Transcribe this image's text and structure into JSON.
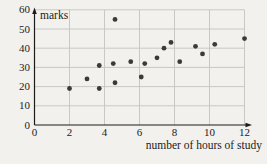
{
  "chart_data": {
    "type": "scatter",
    "title": "",
    "ylabel": "marks",
    "xlabel": "number of hours of study",
    "x_ticks": [
      0,
      2,
      4,
      6,
      8,
      10,
      12
    ],
    "y_ticks": [
      0,
      10,
      20,
      30,
      40,
      50,
      60
    ],
    "xlim": [
      0,
      12.4
    ],
    "ylim": [
      0,
      61
    ],
    "grid": true,
    "legend": "none",
    "points": [
      {
        "x": 2,
        "y": 19
      },
      {
        "x": 3,
        "y": 24
      },
      {
        "x": 3.7,
        "y": 31
      },
      {
        "x": 3.7,
        "y": 19
      },
      {
        "x": 4.5,
        "y": 32
      },
      {
        "x": 4.6,
        "y": 55
      },
      {
        "x": 4.6,
        "y": 22
      },
      {
        "x": 5.5,
        "y": 33
      },
      {
        "x": 6.1,
        "y": 25
      },
      {
        "x": 6.3,
        "y": 32
      },
      {
        "x": 7,
        "y": 35
      },
      {
        "x": 7.4,
        "y": 40
      },
      {
        "x": 7.8,
        "y": 43
      },
      {
        "x": 8.3,
        "y": 33
      },
      {
        "x": 9.2,
        "y": 41
      },
      {
        "x": 9.6,
        "y": 37
      },
      {
        "x": 10.3,
        "y": 42
      },
      {
        "x": 12,
        "y": 45
      }
    ],
    "colors": {
      "background": "#f2f1ee",
      "grid": "#c9c8c5",
      "axis": "#1c1c1c",
      "point": "#3a3a3a",
      "text": "#1b1b1b"
    }
  }
}
